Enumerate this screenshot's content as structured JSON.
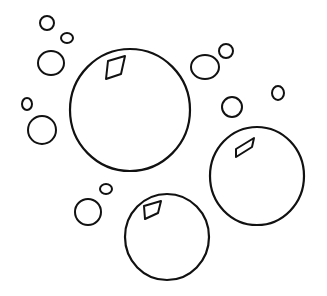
{
  "image": {
    "width": 327,
    "height": 296,
    "background": "#ffffff",
    "stroke_color": "#111111"
  },
  "bubbles": [
    {
      "id": "large-bubble",
      "cx": 130,
      "cy": 110,
      "rx": 60,
      "ry": 61,
      "stroke": 2.2,
      "highlight": "M108,61 L125,56 L121,74 L106,79 Z"
    },
    {
      "id": "right-bubble",
      "cx": 257,
      "cy": 176,
      "rx": 47,
      "ry": 49,
      "stroke": 2.2,
      "highlight": "M236,149 L254,138 L252,147 L236,157 Z"
    },
    {
      "id": "bottom-bubble",
      "cx": 167,
      "cy": 237,
      "rx": 42,
      "ry": 43,
      "stroke": 2.2,
      "highlight": "M144,206 L161,201 L158,213 L145,219 Z"
    },
    {
      "id": "small-bubble-1",
      "cx": 47,
      "cy": 23,
      "rx": 7,
      "ry": 7,
      "stroke": 2
    },
    {
      "id": "small-bubble-2",
      "cx": 67,
      "cy": 38,
      "rx": 6,
      "ry": 5,
      "stroke": 2
    },
    {
      "id": "small-bubble-3",
      "cx": 51,
      "cy": 63,
      "rx": 13,
      "ry": 12,
      "stroke": 2
    },
    {
      "id": "small-bubble-4",
      "cx": 27,
      "cy": 104,
      "rx": 5,
      "ry": 6,
      "stroke": 2
    },
    {
      "id": "small-bubble-5",
      "cx": 42,
      "cy": 130,
      "rx": 14,
      "ry": 14,
      "stroke": 2
    },
    {
      "id": "small-bubble-6",
      "cx": 205,
      "cy": 67,
      "rx": 14,
      "ry": 12,
      "stroke": 2
    },
    {
      "id": "small-bubble-7",
      "cx": 226,
      "cy": 51,
      "rx": 7,
      "ry": 7,
      "stroke": 2
    },
    {
      "id": "small-bubble-8",
      "cx": 232,
      "cy": 107,
      "rx": 10,
      "ry": 10,
      "stroke": 2
    },
    {
      "id": "small-bubble-9",
      "cx": 278,
      "cy": 93,
      "rx": 6,
      "ry": 7,
      "stroke": 2
    },
    {
      "id": "small-bubble-10",
      "cx": 88,
      "cy": 212,
      "rx": 13,
      "ry": 13,
      "stroke": 2
    },
    {
      "id": "small-bubble-11",
      "cx": 106,
      "cy": 189,
      "rx": 6,
      "ry": 5,
      "stroke": 2
    }
  ]
}
